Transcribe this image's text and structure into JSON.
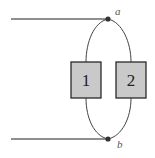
{
  "diagram": {
    "type": "circuit",
    "nodes": [
      {
        "id": "a",
        "label": "a"
      },
      {
        "id": "b",
        "label": "b"
      }
    ],
    "elements": [
      {
        "id": "1",
        "label": "1"
      },
      {
        "id": "2",
        "label": "2"
      }
    ],
    "colors": {
      "wire": "#5a5a5a",
      "box_fill": "#c9c9c9",
      "box_stroke": "#2a2a2a",
      "node": "#333333"
    }
  }
}
